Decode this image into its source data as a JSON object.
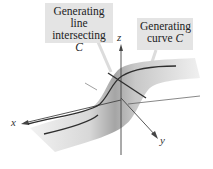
{
  "labels": {
    "generating_line": {
      "line1": "Generating line",
      "line2": "intersecting",
      "line3": "C"
    },
    "generating_curve": {
      "line1": "Generating",
      "line2": "curve",
      "line2_var": "C"
    }
  },
  "axes": {
    "x": "x",
    "y": "y",
    "z": "z"
  },
  "colors": {
    "label_bg": "#e4e4e4",
    "curve": "#333333",
    "axis": "#555555",
    "surface_light": "#ececec",
    "surface_dark": "#9a9a9a"
  }
}
